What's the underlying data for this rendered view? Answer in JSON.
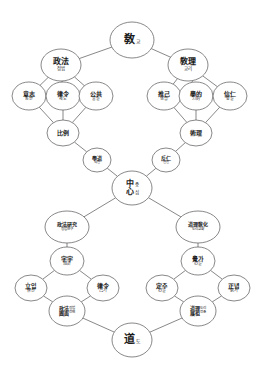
{
  "diagram": {
    "type": "concept-hierarchy",
    "background_color": "#ffffff",
    "line_color": "#555555",
    "text_color": "#1a1a1a",
    "nodes": [
      {
        "id": "gyo-root",
        "name": "root-node-gyo",
        "han": "敎",
        "kor": "교",
        "layout": "inline",
        "size": "root",
        "cx": 132,
        "cy": 40,
        "rx": 22,
        "ry": 18
      },
      {
        "id": "jeongbeop",
        "name": "node-jeongbeop",
        "han": "政法",
        "kor": "정법",
        "layout": "stack",
        "size": "mid",
        "cx": 61,
        "cy": 65,
        "rx": 20,
        "ry": 16
      },
      {
        "id": "gyori",
        "name": "node-gyori",
        "han": "敎理",
        "kor": "교리",
        "layout": "stack",
        "size": "mid",
        "cx": 188,
        "cy": 65,
        "rx": 20,
        "ry": 16
      },
      {
        "id": "uiji",
        "name": "node-uiji-dongan",
        "han": "意志",
        "kor": "동안",
        "layout": "stack",
        "size": "sub",
        "cx": 29,
        "cy": 96,
        "rx": 17,
        "ry": 14
      },
      {
        "id": "yulryeong",
        "name": "node-yulryeong-jedo",
        "han": "律令",
        "kor": "제도",
        "layout": "stack",
        "size": "sub",
        "cx": 63,
        "cy": 96,
        "rx": 17,
        "ry": 14
      },
      {
        "id": "gonggong",
        "name": "node-gonggong-muljil",
        "han": "公共",
        "kor": "물질",
        "layout": "stack",
        "size": "sub",
        "cx": 96,
        "cy": 96,
        "rx": 17,
        "ry": 14
      },
      {
        "id": "chueo",
        "name": "node-chueo-haengbeop",
        "han": "推己",
        "kor": "행법",
        "layout": "stack",
        "size": "sub",
        "cx": 164,
        "cy": 96,
        "rx": 17,
        "ry": 14
      },
      {
        "id": "hakmun",
        "name": "node-hakmun-ryeok",
        "han": "學的",
        "kor": "力的",
        "layout": "stack",
        "size": "sub",
        "cx": 196,
        "cy": 96,
        "rx": 17,
        "ry": 14
      },
      {
        "id": "sinsin",
        "name": "node-sinsin-jungmil",
        "han": "信仁",
        "kor": "충밀",
        "layout": "stack",
        "size": "sub",
        "cx": 230,
        "cy": 96,
        "rx": 17,
        "ry": 14
      },
      {
        "id": "bigyo",
        "name": "node-bigyo",
        "han": "比例",
        "kor": "",
        "layout": "stack",
        "size": "sub",
        "cx": 63,
        "cy": 133,
        "rx": 16,
        "ry": 13
      },
      {
        "id": "sulli",
        "name": "node-sulli",
        "han": "術理",
        "kor": "",
        "layout": "stack",
        "size": "sub",
        "cx": 196,
        "cy": 133,
        "rx": 16,
        "ry": 13
      },
      {
        "id": "hakdo",
        "name": "node-hakdo-inin",
        "han": "學道",
        "kor": "의인",
        "layout": "stack",
        "size": "tiny",
        "cx": 97,
        "cy": 160,
        "rx": 14,
        "ry": 12
      },
      {
        "id": "banin",
        "name": "node-banin-hyeonin",
        "han": "反仁",
        "kor": "현인",
        "layout": "stack",
        "size": "tiny",
        "cx": 166,
        "cy": 160,
        "rx": 14,
        "ry": 12
      },
      {
        "id": "jungsim",
        "name": "center-node-jungsim",
        "han_top": "中",
        "kor_top": "중",
        "han_bottom": "心",
        "kor_bottom": "심",
        "layout": "pair2",
        "size": "mid",
        "cx": 132,
        "cy": 188,
        "rx": 20,
        "ry": 17
      },
      {
        "id": "jeongbeop-yeongu",
        "name": "node-jeongbeop-yeongu",
        "han": "政法硏究",
        "kor": "정법연구",
        "layout": "stack",
        "size": "quad",
        "cx": 67,
        "cy": 227,
        "rx": 22,
        "ry": 16
      },
      {
        "id": "dori-gyohwa",
        "name": "node-dori-gyohwa",
        "han": "道理敎化",
        "kor": "도리교화",
        "layout": "stack",
        "size": "quad",
        "cx": 198,
        "cy": 227,
        "rx": 22,
        "ry": 16
      },
      {
        "id": "jasu-gyugye",
        "name": "node-jasu-gyugye",
        "han": "字宇",
        "kor": "規計",
        "layout": "stack",
        "size": "sub",
        "cx": 67,
        "cy": 261,
        "rx": 17,
        "ry": 14
      },
      {
        "id": "gyeokga-simil",
        "name": "node-gyeokga-simil",
        "han": "覺가",
        "kor": "心일",
        "layout": "stack",
        "size": "sub",
        "cx": 198,
        "cy": 261,
        "rx": 17,
        "ry": 14
      },
      {
        "id": "ipip-susin",
        "name": "node-ipip-susin",
        "han": "立입",
        "kor": "修신",
        "layout": "stack",
        "size": "sub",
        "cx": 31,
        "cy": 288,
        "rx": 16,
        "ry": 13
      },
      {
        "id": "yulryeong-gigi",
        "name": "node-yulryeong-gigi",
        "han": "律令",
        "kor": "己기",
        "layout": "stack",
        "size": "sub",
        "cx": 103,
        "cy": 288,
        "rx": 16,
        "ry": 13
      },
      {
        "id": "jeongju-simil",
        "name": "node-jeongju-simil",
        "han": "定주",
        "kor": "心일",
        "layout": "stack",
        "size": "sub",
        "cx": 162,
        "cy": 288,
        "rx": 16,
        "ry": 13
      },
      {
        "id": "jeongnyeom-gigi",
        "name": "node-jeongnyeom-gigi",
        "han": "正념",
        "kor": "氣기",
        "layout": "stack",
        "size": "sub",
        "cx": 234,
        "cy": 288,
        "rx": 16,
        "ry": 13
      },
      {
        "id": "jeongbeop-jeonmyeon",
        "name": "node-jeongbeop-jeonmyeon",
        "han": "政法",
        "han2": "圓面",
        "kor": "정법",
        "kor2": "전면",
        "layout": "quadcol",
        "size": "quad",
        "cx": 67,
        "cy": 311,
        "rx": 18,
        "ry": 15
      },
      {
        "id": "dori-jeonjo",
        "name": "node-dori-jeonjo",
        "han": "道理",
        "han2": "展祖",
        "kor": "도리",
        "kor2": "전조",
        "layout": "quadcol",
        "size": "quad",
        "cx": 198,
        "cy": 311,
        "rx": 18,
        "ry": 15
      },
      {
        "id": "do-root",
        "name": "root-node-do",
        "han": "道",
        "kor": "도",
        "layout": "inline",
        "size": "root",
        "cx": 132,
        "cy": 340,
        "rx": 20,
        "ry": 17
      }
    ],
    "edges": [
      {
        "name": "edge-gyo-jeongbeop",
        "from": "gyo-root",
        "to": "jeongbeop"
      },
      {
        "name": "edge-gyo-gyori",
        "from": "gyo-root",
        "to": "gyori"
      },
      {
        "name": "edge-jeongbeop-uiji",
        "from": "jeongbeop",
        "to": "uiji"
      },
      {
        "name": "edge-jeongbeop-yulryeong",
        "from": "jeongbeop",
        "to": "yulryeong"
      },
      {
        "name": "edge-jeongbeop-gonggong",
        "from": "jeongbeop",
        "to": "gonggong"
      },
      {
        "name": "edge-gyori-chueo",
        "from": "gyori",
        "to": "chueo"
      },
      {
        "name": "edge-gyori-hakmun",
        "from": "gyori",
        "to": "hakmun"
      },
      {
        "name": "edge-gyori-sinsin",
        "from": "gyori",
        "to": "sinsin"
      },
      {
        "name": "edge-uiji-bigyo",
        "from": "uiji",
        "to": "bigyo"
      },
      {
        "name": "edge-yulryeong-bigyo",
        "from": "yulryeong",
        "to": "bigyo"
      },
      {
        "name": "edge-gonggong-bigyo",
        "from": "gonggong",
        "to": "bigyo"
      },
      {
        "name": "edge-chueo-sulli",
        "from": "chueo",
        "to": "sulli"
      },
      {
        "name": "edge-hakmun-sulli",
        "from": "hakmun",
        "to": "sulli"
      },
      {
        "name": "edge-sinsin-sulli",
        "from": "sinsin",
        "to": "sulli"
      },
      {
        "name": "edge-bigyo-hakdo",
        "from": "bigyo",
        "to": "hakdo"
      },
      {
        "name": "edge-sulli-banin",
        "from": "sulli",
        "to": "banin"
      },
      {
        "name": "edge-hakdo-jungsim",
        "from": "hakdo",
        "to": "jungsim"
      },
      {
        "name": "edge-banin-jungsim",
        "from": "banin",
        "to": "jungsim"
      },
      {
        "name": "edge-jungsim-jeongbeopyeongu",
        "from": "jungsim",
        "to": "jeongbeop-yeongu"
      },
      {
        "name": "edge-jungsim-dorigyohwa",
        "from": "jungsim",
        "to": "dori-gyohwa"
      },
      {
        "name": "edge-jeongbeopyeongu-jasu",
        "from": "jeongbeop-yeongu",
        "to": "jasu-gyugye"
      },
      {
        "name": "edge-dorigyohwa-gyeokga",
        "from": "dori-gyohwa",
        "to": "gyeokga-simil"
      },
      {
        "name": "edge-jasu-ipip",
        "from": "jasu-gyugye",
        "to": "ipip-susin"
      },
      {
        "name": "edge-jasu-yulryeonggigi",
        "from": "jasu-gyugye",
        "to": "yulryeong-gigi"
      },
      {
        "name": "edge-ipip-jeongbeopjeonmyeon",
        "from": "ipip-susin",
        "to": "jeongbeop-jeonmyeon"
      },
      {
        "name": "edge-yulryeonggigi-jeongbeopjeonmyeon",
        "from": "yulryeong-gigi",
        "to": "jeongbeop-jeonmyeon"
      },
      {
        "name": "edge-gyeokga-jeongju",
        "from": "gyeokga-simil",
        "to": "jeongju-simil"
      },
      {
        "name": "edge-gyeokga-jeongnyeom",
        "from": "gyeokga-simil",
        "to": "jeongnyeom-gigi"
      },
      {
        "name": "edge-jeongju-dorijeonjo",
        "from": "jeongju-simil",
        "to": "dori-jeonjo"
      },
      {
        "name": "edge-jeongnyeom-dorijeonjo",
        "from": "jeongnyeom-gigi",
        "to": "dori-jeonjo"
      },
      {
        "name": "edge-jeongbeopjeonmyeon-do",
        "from": "jeongbeop-jeonmyeon",
        "to": "do-root"
      },
      {
        "name": "edge-dorijeonjo-do",
        "from": "dori-jeonjo",
        "to": "do-root"
      }
    ]
  }
}
